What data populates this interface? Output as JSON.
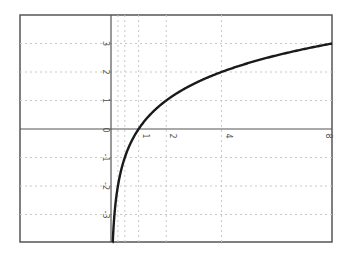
{
  "chart_data": {
    "type": "line",
    "title": "",
    "xlabel": "",
    "ylabel": "",
    "function": "y = log2(x)",
    "series": [
      {
        "name": "log2(x)",
        "x": [
          0.0625,
          0.125,
          0.25,
          0.5,
          1,
          2,
          3,
          4,
          5,
          6,
          7,
          8
        ],
        "values": [
          -4,
          -3,
          -2,
          -1,
          0,
          1,
          1.585,
          2,
          2.322,
          2.585,
          2.807,
          3
        ]
      }
    ],
    "xlim": [
      -3.3,
      8
    ],
    "ylim": [
      -4,
      4
    ],
    "x_ticks": [
      {
        "value": 1,
        "label": "1"
      },
      {
        "value": 2,
        "label": "2"
      },
      {
        "value": 4,
        "label": "4"
      },
      {
        "value": 8,
        "label": "8"
      }
    ],
    "x_minor_grid": [
      0.25,
      0.5
    ],
    "y_ticks": [
      {
        "value": 3,
        "label": "3"
      },
      {
        "value": 2,
        "label": "2"
      },
      {
        "value": 1,
        "label": "1"
      },
      {
        "value": -1,
        "label": "-1"
      },
      {
        "value": -2,
        "label": "-2"
      },
      {
        "value": -3,
        "label": "-3"
      }
    ],
    "origin_label": "0",
    "grid": true,
    "legend": "none",
    "labels_rotated": true
  },
  "colors": {
    "curve": "#1a1a1a",
    "axis": "#555555",
    "grid": "#c8c8c8",
    "frame": "#555555"
  }
}
